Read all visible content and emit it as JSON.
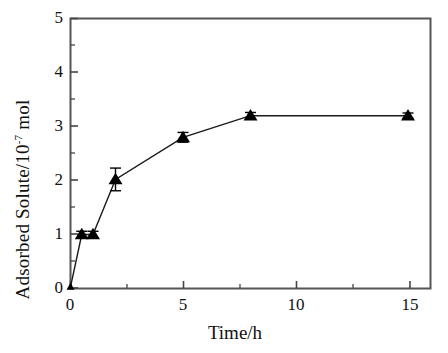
{
  "chart_data": {
    "type": "line",
    "title": "",
    "subtitle": "",
    "xlabel": "Time/h",
    "ylabel_text": "Adsorbed Solute/10",
    "ylabel_superscript": "-7",
    "ylabel_unit": " mol",
    "ylabel_full": "Adsorbed Solute/10-7 mol",
    "xlim": [
      0,
      16
    ],
    "ylim": [
      0,
      5
    ],
    "x_ticks": [
      0,
      5,
      10,
      15
    ],
    "x_tick_labels": [
      "0",
      "5",
      "10",
      "15"
    ],
    "x_minor_ticks": [
      2.5,
      7.5,
      12.5
    ],
    "y_ticks": [
      0,
      1,
      2,
      3,
      4,
      5
    ],
    "y_tick_labels": [
      "0",
      "1",
      "2",
      "3",
      "4",
      "5"
    ],
    "y_minor_ticks": [
      0.5,
      1.5,
      2.5,
      3.5,
      4.5
    ],
    "grid": false,
    "legend": false,
    "legend_position": "none",
    "marker": "filled-triangle",
    "marker_color": "#000000",
    "line_color": "#000000",
    "frame_color": "#555555",
    "series": [
      {
        "name": "Adsorbed Solute",
        "x": [
          0,
          0.5,
          1,
          2,
          5,
          8,
          15
        ],
        "values": [
          0.03,
          1.0,
          1.0,
          2.02,
          2.8,
          3.2,
          3.2
        ],
        "yerr": [
          0,
          0.06,
          0.06,
          0.21,
          0.09,
          0.06,
          0.05
        ]
      }
    ]
  },
  "axes": {
    "x_label": "Time/h",
    "y_label_prefix": "Adsorbed Solute/10",
    "y_label_sup": "-7",
    "y_label_suffix": " mol"
  }
}
